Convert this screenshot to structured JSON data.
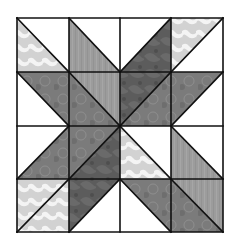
{
  "grid": {
    "x": [
      17,
      69,
      120,
      171,
      223
    ],
    "y": [
      18,
      72,
      126,
      179,
      232
    ],
    "rows": 4,
    "cols": 4
  },
  "palette": {
    "white": "#ffffff",
    "light_print": "#cdcdcd",
    "medium_gray": "#9c9c9c",
    "medium_dark_print": "#7b7b7b",
    "dark_print": "#5c5c5c",
    "seam": "#111111"
  },
  "cells": [
    {
      "row": 0,
      "col": 0,
      "diagonal": "\\",
      "upper_right": "white",
      "lower_left": "light_print"
    },
    {
      "row": 0,
      "col": 1,
      "diagonal": "\\",
      "upper_right": "white",
      "lower_left": "medium_gray"
    },
    {
      "row": 0,
      "col": 2,
      "diagonal": "/",
      "upper_left": "white",
      "lower_right": "dark_print"
    },
    {
      "row": 0,
      "col": 3,
      "diagonal": "/",
      "upper_left": "light_print",
      "lower_right": "white"
    },
    {
      "row": 1,
      "col": 0,
      "diagonal": "\\",
      "upper_right": "medium_dark_print",
      "lower_left": "white"
    },
    {
      "row": 1,
      "col": 1,
      "diagonal": "\\",
      "upper_right": "medium_gray",
      "lower_left": "medium_dark_print"
    },
    {
      "row": 1,
      "col": 2,
      "diagonal": "/",
      "upper_left": "dark_print",
      "lower_right": "medium_dark_print"
    },
    {
      "row": 1,
      "col": 3,
      "diagonal": "/",
      "upper_left": "medium_dark_print",
      "lower_right": "white"
    },
    {
      "row": 2,
      "col": 0,
      "diagonal": "/",
      "upper_left": "white",
      "lower_right": "medium_dark_print"
    },
    {
      "row": 2,
      "col": 1,
      "diagonal": "/",
      "upper_left": "medium_dark_print",
      "lower_right": "dark_print"
    },
    {
      "row": 2,
      "col": 2,
      "diagonal": "\\",
      "upper_right": "white",
      "lower_left": "light_print"
    },
    {
      "row": 2,
      "col": 3,
      "diagonal": "\\",
      "upper_right": "white",
      "lower_left": "medium_gray"
    },
    {
      "row": 3,
      "col": 0,
      "diagonal": "/",
      "upper_left": "light_print",
      "lower_right": "light_print"
    },
    {
      "row": 3,
      "col": 1,
      "diagonal": "/",
      "upper_left": "dark_print",
      "lower_right": "white"
    },
    {
      "row": 3,
      "col": 2,
      "diagonal": "\\",
      "upper_right": "medium_dark_print",
      "lower_left": "white"
    },
    {
      "row": 3,
      "col": 3,
      "diagonal": "\\",
      "upper_right": "medium_gray",
      "lower_left": "medium_dark_print"
    }
  ]
}
